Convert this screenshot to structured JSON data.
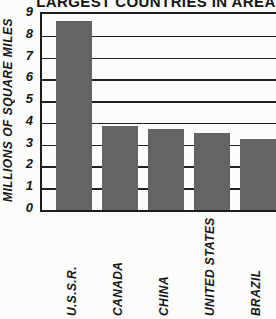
{
  "title": "LARGEST COUNTRIES IN AREA",
  "chart_data": {
    "type": "bar",
    "title": "LARGEST COUNTRIES IN AREA",
    "categories": [
      "U.S.S.R.",
      "CANADA",
      "CHINA",
      "UNITED STATES",
      "BRAZIL"
    ],
    "values": [
      8.7,
      3.85,
      3.7,
      3.55,
      3.25
    ],
    "xlabel": "",
    "ylabel": "MILLIONS OF SQUARE MILES",
    "ylim": [
      0,
      9
    ],
    "yticks": [
      0,
      1,
      2,
      3,
      4,
      5,
      6,
      7,
      8,
      9
    ],
    "grid": true,
    "legend": false,
    "bar_color": "#646464"
  },
  "colors": {
    "bar": "#646464",
    "axis_line": "#1c1c1c",
    "gridline": "#222222",
    "text": "#121212",
    "background": "#fcfcfa"
  }
}
